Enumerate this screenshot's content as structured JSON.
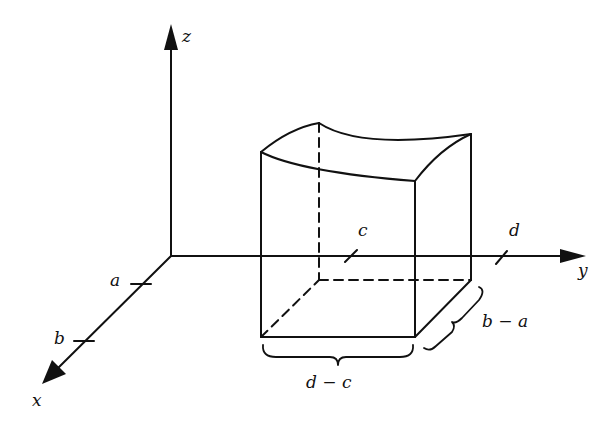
{
  "figure": {
    "axes": {
      "x_label": "x",
      "y_label": "y",
      "z_label": "z"
    },
    "ticks": {
      "x_tick_1": "a",
      "x_tick_2": "b",
      "y_tick_1": "c",
      "y_tick_2": "d"
    },
    "dimensions": {
      "width_label": "d − c",
      "depth_label": "b − a"
    },
    "colors": {
      "stroke": "#111111",
      "background": "#ffffff"
    }
  }
}
